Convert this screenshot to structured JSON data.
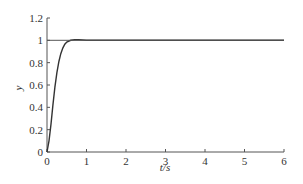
{
  "chart_data": {
    "type": "line",
    "title": "",
    "xlabel": "t/s",
    "ylabel": "y",
    "xlim": [
      0,
      6
    ],
    "ylim": [
      0,
      1.2
    ],
    "x_ticks": [
      "0",
      "1",
      "2",
      "3",
      "4",
      "5",
      "6"
    ],
    "y_ticks": [
      "0",
      "0.2",
      "0.4",
      "0.6",
      "0.8",
      "1",
      "1.2"
    ],
    "grid": false,
    "legend": null,
    "series": [
      {
        "name": "step response",
        "x": [
          0,
          0.05,
          0.1,
          0.15,
          0.2,
          0.25,
          0.3,
          0.35,
          0.4,
          0.45,
          0.5,
          0.6,
          0.7,
          0.8,
          0.9,
          1.0,
          1.5,
          2,
          3,
          4,
          5,
          6
        ],
        "y": [
          0,
          0.1,
          0.25,
          0.42,
          0.58,
          0.71,
          0.81,
          0.88,
          0.93,
          0.965,
          0.985,
          1.0,
          1.005,
          1.006,
          1.003,
          1.0,
          1.0,
          1.0,
          1.0,
          1.0,
          1.0,
          1.0
        ]
      },
      {
        "name": "reference",
        "x": [
          0,
          6
        ],
        "y": [
          1,
          1
        ]
      }
    ]
  }
}
